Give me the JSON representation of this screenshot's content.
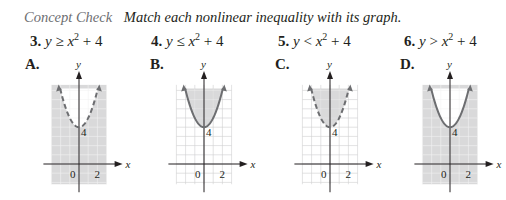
{
  "header": {
    "concept_label": "Concept Check",
    "instruction": "Match each nonlinear inequality with its graph."
  },
  "problems": [
    {
      "number": "3.",
      "lhs": "y",
      "op": "≥",
      "base": "x",
      "exp": "2",
      "rest": "+ 4"
    },
    {
      "number": "4.",
      "lhs": "y",
      "op": "≤",
      "base": "x",
      "exp": "2",
      "rest": "+ 4"
    },
    {
      "number": "5.",
      "lhs": "y",
      "op": "<",
      "base": "x",
      "exp": "2",
      "rest": "+ 4"
    },
    {
      "number": "6.",
      "lhs": "y",
      "op": ">",
      "base": "x",
      "exp": "2",
      "rest": "+ 4"
    }
  ],
  "graphs": [
    {
      "label": "A.",
      "boundary": "dashed",
      "shading": "outside",
      "vertex_label": "4",
      "x_tick_labels": [
        "0",
        "2"
      ],
      "x_axis_label": "x",
      "y_axis_label": "y"
    },
    {
      "label": "B.",
      "boundary": "solid",
      "shading": "inside",
      "vertex_label": "4",
      "x_tick_labels": [
        "0",
        "2"
      ],
      "x_axis_label": "x",
      "y_axis_label": "y"
    },
    {
      "label": "C.",
      "boundary": "dashed",
      "shading": "inside",
      "vertex_label": "4",
      "x_tick_labels": [
        "0",
        "2"
      ],
      "x_axis_label": "x",
      "y_axis_label": "y"
    },
    {
      "label": "D.",
      "boundary": "solid",
      "shading": "outside",
      "vertex_label": "4",
      "x_tick_labels": [
        "0",
        "2"
      ],
      "x_axis_label": "x",
      "y_axis_label": "y"
    }
  ],
  "colors": {
    "curve": "#6d6e71",
    "shade": "#d9d9da",
    "grid": "#ffffff",
    "axis": "#231f20"
  }
}
